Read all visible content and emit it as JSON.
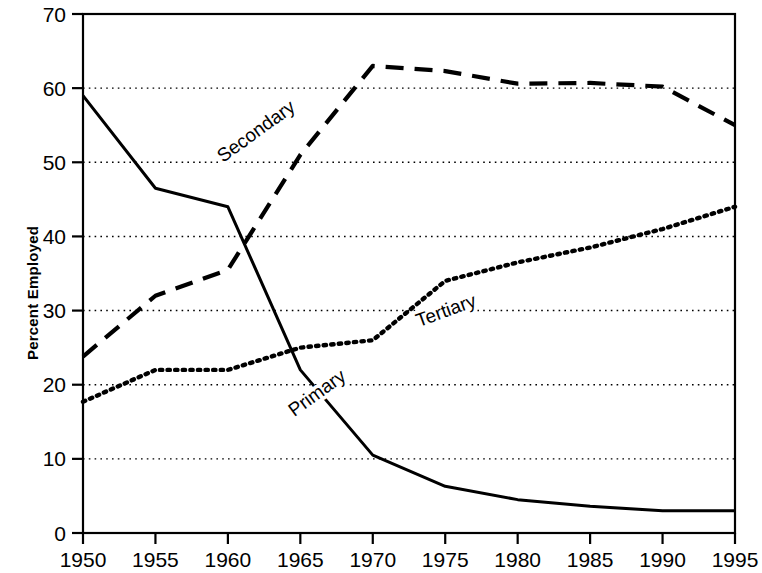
{
  "chart_data": {
    "type": "line",
    "title": "",
    "subtitle": "",
    "xlabel": "",
    "ylabel": "Percent Employed",
    "x": [
      1950,
      1955,
      1960,
      1965,
      1970,
      1975,
      1980,
      1985,
      1990,
      1995
    ],
    "xtick_labels": [
      "1950",
      "1955",
      "1960",
      "1965",
      "1970",
      "1975",
      "1980",
      "1985",
      "1990",
      "1995"
    ],
    "ytick_labels": [
      "0",
      "10",
      "20",
      "30",
      "40",
      "50",
      "60",
      "70"
    ],
    "ytick_values": [
      0,
      10,
      20,
      30,
      40,
      50,
      60,
      70
    ],
    "xlim": [
      1950,
      1995
    ],
    "ylim": [
      0,
      70
    ],
    "grid": "horizontal-dotted",
    "legend_position": "inline-annotations",
    "series": [
      {
        "name": "Primary",
        "style": "solid",
        "color": "#000000",
        "label_x": 1966.4,
        "label_y": 18.2,
        "label_rotation": -36,
        "values": [
          59,
          46.5,
          44,
          22,
          10.5,
          6.3,
          4.5,
          3.6,
          3.0,
          3.0
        ]
      },
      {
        "name": "Secondary",
        "style": "dashed",
        "color": "#000000",
        "label_x": 1962.2,
        "label_y": 53.5,
        "label_rotation": -36,
        "values": [
          23.8,
          32.0,
          35.5,
          51.0,
          63.0,
          62.3,
          60.6,
          60.7,
          60.2,
          55.0
        ]
      },
      {
        "name": "Tertiary",
        "style": "dotted",
        "color": "#000000",
        "label_x": 1975.2,
        "label_y": 29.2,
        "label_rotation": -20,
        "values": [
          17.7,
          22.0,
          22.0,
          25.0,
          26.0,
          34.0,
          36.5,
          38.5,
          41.0,
          44.0
        ]
      }
    ]
  }
}
